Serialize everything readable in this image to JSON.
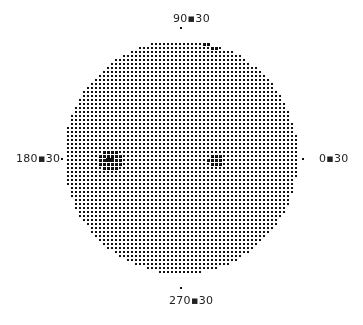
{
  "figure": {
    "type": "pole-figure-dot-plot",
    "labels": {
      "top": "90▪30",
      "left": "180▪30",
      "right": "0▪30",
      "bottom": "270▪30"
    },
    "circle": {
      "cx": 181,
      "cy": 157,
      "r": 117
    },
    "dot_spacing": 4,
    "dot_color": "#111111",
    "background": "#ffffff",
    "hotspots": [
      {
        "name": "left-dense",
        "cx": 110,
        "cy": 160,
        "r": 16,
        "strength": 1.0
      },
      {
        "name": "center-right",
        "cx": 215,
        "cy": 160,
        "r": 12,
        "strength": 0.6
      },
      {
        "name": "top",
        "cx": 213,
        "cy": 38,
        "r": 16,
        "strength": 0.8
      }
    ]
  }
}
